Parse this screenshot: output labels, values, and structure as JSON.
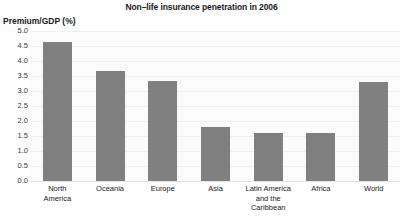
{
  "chart_data": {
    "type": "bar",
    "title": "Non–life insurance penetration in 2006",
    "xlabel": "",
    "ylabel": "Premium/GDP (%)",
    "categories": [
      "North America",
      "Oceania",
      "Europe",
      "Asia",
      "Latin America and the Caribbean",
      "Africa",
      "World"
    ],
    "category_lines": [
      [
        "North",
        "America"
      ],
      [
        "Oceania",
        ""
      ],
      [
        "Europe",
        ""
      ],
      [
        "Asia",
        ""
      ],
      [
        "Latin America",
        "and the Caribbean"
      ],
      [
        "Africa",
        ""
      ],
      [
        "World",
        ""
      ]
    ],
    "values": [
      4.65,
      3.67,
      3.35,
      1.8,
      1.6,
      1.6,
      3.3
    ],
    "ylim": [
      0.0,
      5.0
    ],
    "ytick_labels": [
      "5.0",
      "4.5",
      "4.0",
      "3.5",
      "3.0",
      "2.5",
      "2.0",
      "1.5",
      "1.0",
      "0.5",
      "0.0"
    ],
    "ytick_values": [
      5.0,
      4.5,
      4.0,
      3.5,
      3.0,
      2.5,
      2.0,
      1.5,
      1.0,
      0.5,
      0.0
    ],
    "grid": true,
    "legend": "none",
    "bar_color": "#808080",
    "plot_background": "#fbfbfb",
    "gridline_color": "#f0f0f0",
    "text_color": "#1a1a1a"
  }
}
